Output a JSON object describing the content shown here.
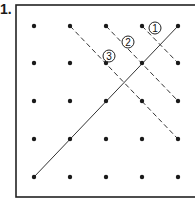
{
  "problem": {
    "number": "1."
  },
  "frame": {
    "x": 16,
    "y": 5,
    "width": 182,
    "height": 192,
    "stroke": "#222222"
  },
  "grid": {
    "columns": [
      34,
      70,
      106,
      142,
      178
    ],
    "rows": [
      26,
      63,
      101,
      139,
      177
    ],
    "dot_color": "#1a1a1a",
    "dot_radius": 2.2
  },
  "lines": [
    {
      "id": "solid",
      "style": "solid",
      "from": [
        34,
        177
      ],
      "to": [
        178,
        26
      ]
    },
    {
      "id": "1",
      "style": "dashed",
      "from": [
        142,
        26
      ],
      "to": [
        178,
        63
      ]
    },
    {
      "id": "2",
      "style": "dashed",
      "from": [
        106,
        26
      ],
      "to": [
        178,
        101
      ]
    },
    {
      "id": "3",
      "style": "dashed",
      "from": [
        70,
        26
      ],
      "to": [
        178,
        139
      ]
    }
  ],
  "labels": [
    {
      "text": "1",
      "x": 155,
      "y": 28
    },
    {
      "text": "2",
      "x": 128,
      "y": 42
    },
    {
      "text": "3",
      "x": 109,
      "y": 56
    }
  ]
}
